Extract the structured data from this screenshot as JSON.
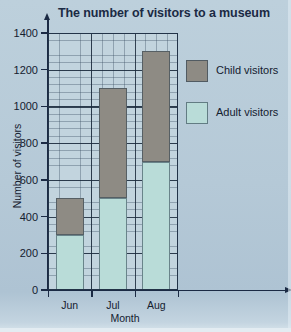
{
  "chart_data": {
    "type": "bar",
    "subtype": "stacked",
    "title": "The number of visitors to a museum",
    "xlabel": "Month",
    "ylabel": "Number of visitors",
    "categories": [
      "Jun",
      "Jul",
      "Aug"
    ],
    "series": [
      {
        "name": "Adult visitors",
        "values": [
          300,
          500,
          700
        ],
        "color": "#b9dcd8"
      },
      {
        "name": "Child visitors",
        "values": [
          200,
          600,
          600
        ],
        "color": "#8e8b84"
      }
    ],
    "totals": [
      500,
      1100,
      1300
    ],
    "ylim": [
      0,
      1400
    ],
    "ytick_step": 200,
    "yticks": [
      0,
      200,
      400,
      600,
      800,
      1000,
      1200,
      1400
    ],
    "ytick_labels": [
      "0",
      "200",
      "400",
      "600",
      "800",
      "1000",
      "1200",
      "1400"
    ],
    "minor_gridline_step": 40,
    "grid": true,
    "legend_position": "right",
    "legend_order": [
      "Child visitors",
      "Adult visitors"
    ]
  },
  "colors": {
    "page_background": "#b7cbd9",
    "plot_background": "#c2d4de",
    "axis": "#1b2a44",
    "title_text": "#1b2a44",
    "label_text": "#14202f",
    "adult_bar": "#b9dcd8",
    "child_bar": "#8e8b84"
  }
}
